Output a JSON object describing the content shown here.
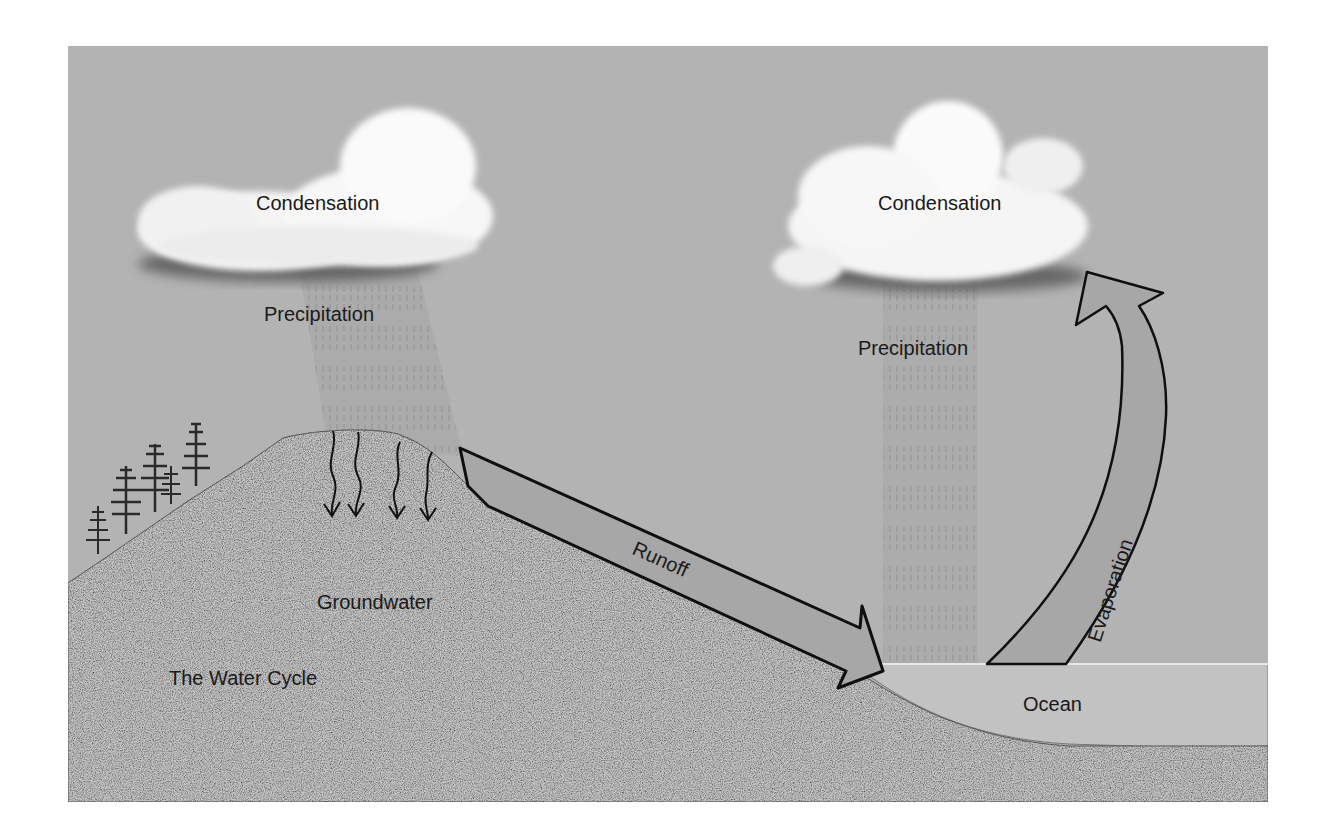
{
  "diagram": {
    "title": "The Water Cycle",
    "colors": {
      "sky": "#b3b3b3",
      "land": "#c9c9c9",
      "ocean": "#c4c4c4",
      "arrow_fill": "#a8a8a8",
      "outline": "#111111",
      "cloud": "#f7f7f7"
    },
    "labels": {
      "left_cloud": "Condensation",
      "left_rain": "Precipitation",
      "groundwater": "Groundwater",
      "runoff": "Runoff",
      "right_cloud": "Condensation",
      "right_rain": "Precipitation",
      "evaporation": "Evaporation",
      "ocean": "Ocean",
      "caption": "The Water Cycle"
    },
    "elements": [
      {
        "name": "left-cloud",
        "label": "Condensation"
      },
      {
        "name": "left-rain",
        "label": "Precipitation"
      },
      {
        "name": "hill-with-trees"
      },
      {
        "name": "groundwater-arrows",
        "count": 4,
        "label": "Groundwater"
      },
      {
        "name": "runoff-arrow",
        "label": "Runoff",
        "direction": "down-right"
      },
      {
        "name": "right-cloud",
        "label": "Condensation"
      },
      {
        "name": "right-rain",
        "label": "Precipitation"
      },
      {
        "name": "evaporation-arrow",
        "label": "Evaporation",
        "direction": "up-left"
      },
      {
        "name": "ocean",
        "label": "Ocean"
      }
    ]
  }
}
